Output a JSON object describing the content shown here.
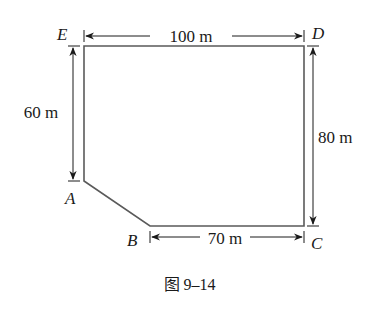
{
  "figure": {
    "caption": "图 9–14",
    "shape": "pentagon ABCDE (rectangle with corner cut)",
    "stroke_color": "#555555",
    "dim_color": "#1a1a1a"
  },
  "vertices": {
    "E": {
      "label": "E",
      "x": 84,
      "y": 46
    },
    "D": {
      "label": "D",
      "x": 304,
      "y": 46
    },
    "C": {
      "label": "C",
      "x": 304,
      "y": 226
    },
    "B": {
      "label": "B",
      "x": 150,
      "y": 226
    },
    "A": {
      "label": "A",
      "x": 84,
      "y": 181
    }
  },
  "dimensions": {
    "top": {
      "label": "100 m",
      "from": "E",
      "to": "D",
      "value": 100,
      "unit": "m"
    },
    "left": {
      "label": "60 m",
      "from": "E",
      "to": "A",
      "value": 60,
      "unit": "m"
    },
    "right": {
      "label": "80 m",
      "from": "D",
      "to": "C",
      "value": 80,
      "unit": "m"
    },
    "bottom": {
      "label": "70 m",
      "from": "B",
      "to": "C",
      "value": 70,
      "unit": "m"
    }
  }
}
